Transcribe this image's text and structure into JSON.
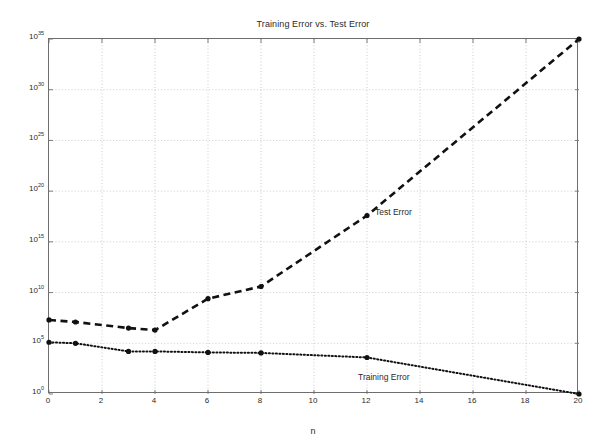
{
  "chart_data": {
    "type": "line",
    "title": "Training Error vs. Test Error",
    "xlabel": "n",
    "ylabel": "",
    "yscale": "log",
    "xlim": [
      0,
      20
    ],
    "ylim": [
      1,
      1e+35
    ],
    "grid": true,
    "legend_position": "inline-annotations",
    "xticks": [
      0,
      2,
      4,
      6,
      8,
      10,
      12,
      14,
      16,
      18,
      20
    ],
    "xtick_labels": [
      "0",
      "2",
      "4",
      "6",
      "8",
      "10",
      "12",
      "14",
      "16",
      "18",
      "20"
    ],
    "yticks": [
      1,
      100000.0,
      10000000000.0,
      1000000000000000.0,
      1e+20,
      1e+25,
      1e+30,
      1e+35
    ],
    "ytick_labels": [
      "10^0",
      "10^5",
      "10^10",
      "10^15",
      "10^20",
      "10^25",
      "10^30",
      "10^35"
    ],
    "ytick_mantissas": [
      "10",
      "10",
      "10",
      "10",
      "10",
      "10",
      "10",
      "10"
    ],
    "ytick_exponents": [
      "0",
      "5",
      "10",
      "15",
      "20",
      "25",
      "30",
      "35"
    ],
    "series": [
      {
        "name": "Test Error",
        "label": "Test Error",
        "style": "dashed",
        "marker": "filled-circle",
        "color": "#111111",
        "x": [
          0,
          1,
          3,
          4,
          6,
          8,
          12,
          20
        ],
        "y_log10": [
          7.3,
          7.1,
          6.5,
          6.3,
          9.4,
          10.6,
          17.6,
          35.0
        ],
        "values": [
          20000000.0,
          13000000.0,
          3200000.0,
          2000000.0,
          2500000000.0,
          40000000000.0,
          4e+17,
          1e+35
        ]
      },
      {
        "name": "Training Error",
        "label": "Training Error",
        "style": "dotted",
        "marker": "filled-circle",
        "color": "#111111",
        "x": [
          0,
          1,
          3,
          4,
          6,
          8,
          12,
          20
        ],
        "y_log10": [
          5.1,
          5.0,
          4.2,
          4.2,
          4.1,
          4.05,
          3.6,
          0.0
        ],
        "values": [
          130000.0,
          100000.0,
          16000.0,
          16000.0,
          13000.0,
          11000.0,
          4000.0,
          1.0
        ]
      }
    ]
  },
  "figure": {
    "background": "#ffffff",
    "axis_color": "#6e6e6e",
    "grid_color": "#b4b4b4",
    "ink_color": "#111111"
  }
}
